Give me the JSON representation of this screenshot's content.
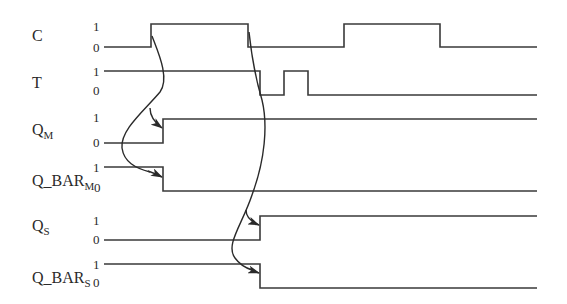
{
  "diagram": {
    "type": "timing-diagram",
    "stroke_color": "#3a3a3a",
    "signals": [
      {
        "name": "C",
        "label_main": "C",
        "label_sub": "",
        "high_label": "1",
        "low_label": "0"
      },
      {
        "name": "T",
        "label_main": "T",
        "label_sub": "",
        "high_label": "1",
        "low_label": "0"
      },
      {
        "name": "Q_M",
        "label_main": "Q",
        "label_sub": "M",
        "high_label": "1",
        "low_label": "0"
      },
      {
        "name": "Q_BAR_M",
        "label_main": "Q_BAR",
        "label_sub": "M",
        "high_label": "1",
        "low_label": "0"
      },
      {
        "name": "Q_S",
        "label_main": "Q",
        "label_sub": "S",
        "high_label": "1",
        "low_label": "0"
      },
      {
        "name": "Q_BAR_S",
        "label_main": "Q_BAR",
        "label_sub": "S",
        "high_label": "1",
        "low_label": "0"
      }
    ],
    "waveforms": {
      "C": "0 -> 1 (x≈151) -> 0 (x≈248) -> 1 (x≈344) -> 0 (x≈440)",
      "T": "1 -> 0 (x≈260) -> 1 (x≈284) -> 0 (x≈308)",
      "Q_M": "0 -> 1 (x≈163)",
      "Q_BAR_M": "1 -> 0 (x≈163)",
      "Q_S": "0 -> 1 (x≈260)",
      "Q_BAR_S": "1 -> 0 (x≈260)"
    },
    "causal_arrows": [
      {
        "from": "C rising edge",
        "to": [
          "Q_M rising",
          "Q_BAR_M falling"
        ]
      },
      {
        "from": "C falling edge",
        "to": [
          "Q_S rising",
          "Q_BAR_S falling"
        ]
      }
    ]
  }
}
